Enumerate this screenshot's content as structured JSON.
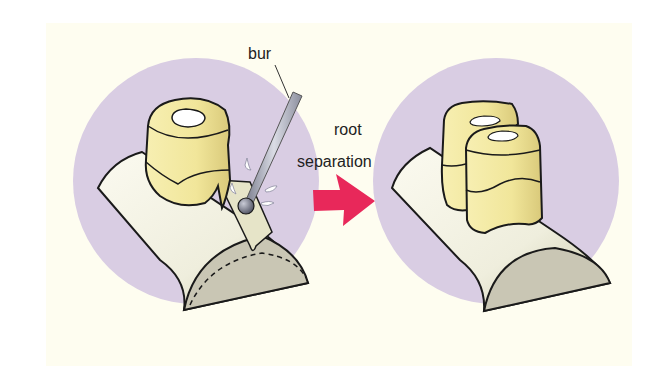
{
  "diagram": {
    "labels": {
      "bur": "bur",
      "step_line1": "root",
      "step_line2": "separation"
    },
    "panels": [
      {
        "name": "before",
        "description": "Bur cutting through furcation of multi-rooted tooth on alveolar ridge"
      },
      {
        "name": "after",
        "description": "Tooth separated into two independent roots/crowns"
      }
    ],
    "colors": {
      "background": "#fefdf0",
      "circle": "#d9cde3",
      "tooth": "#f1e79a",
      "ridge": "#ecebdc",
      "ridge_section": "#c9c6b4",
      "arrow": "#e8285a",
      "bur": "#a7aab8",
      "outline": "#1a1a1a"
    }
  }
}
